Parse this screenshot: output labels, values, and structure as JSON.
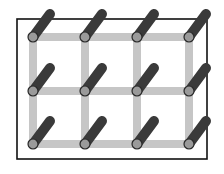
{
  "diagram": {
    "type": "lattice-grid-with-rods",
    "frame": {
      "x": 17,
      "y": 19,
      "width": 190,
      "height": 140,
      "stroke": "#111111",
      "stroke_width": 1.6
    },
    "grid": {
      "columns_x": [
        33,
        85,
        137,
        189
      ],
      "rows_y": [
        37,
        91,
        144
      ],
      "bar_color": "#c6c6c6",
      "bar_width": 8
    },
    "rods": {
      "dx": 17,
      "dy": -23,
      "color": "#3a3a3a",
      "width": 10
    },
    "nodes": {
      "radius": 5,
      "fill": "#9a9a9a",
      "stroke": "#2a2a2a",
      "count": 12
    }
  }
}
